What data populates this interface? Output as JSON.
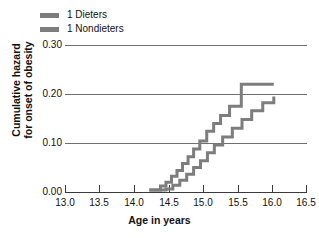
{
  "legend": {
    "items": [
      {
        "label": "1 Dieters",
        "color": "#7d7d7d",
        "key": "dieters"
      },
      {
        "label": "1 Nondieters",
        "color": "#7d7d7d",
        "key": "nondieters"
      }
    ]
  },
  "axes": {
    "x_label": "Age in years",
    "y_label_line1": "Cumulative hazard",
    "y_label_line2": "for onset of obesity",
    "x_ticks": [
      "13.0",
      "13.5",
      "14.0",
      "14.5",
      "15.0",
      "15.5",
      "16.0",
      "16.5"
    ],
    "y_ticks": [
      "0.30",
      "0.20",
      "0.10",
      "0.00"
    ]
  },
  "chart_data": {
    "type": "line",
    "subtype": "step",
    "title": "",
    "xlabel": "Age in years",
    "ylabel": "Cumulative hazard for onset of obesity",
    "xlim": [
      13.0,
      16.5
    ],
    "ylim": [
      0.0,
      0.3
    ],
    "xticks": [
      13.0,
      13.5,
      14.0,
      14.5,
      15.0,
      15.5,
      16.0,
      16.5
    ],
    "yticks": [
      0.0,
      0.1,
      0.2,
      0.3
    ],
    "grid": "horizontal",
    "legend_position": "top-left-outside",
    "line_color": "#7d7d7d",
    "line_width": 3,
    "series": [
      {
        "name": "1 Dieters",
        "color": "#7d7d7d",
        "x": [
          14.22,
          14.3,
          14.38,
          14.46,
          14.54,
          14.62,
          14.7,
          14.78,
          14.86,
          14.95,
          15.05,
          15.15,
          15.25,
          15.38,
          15.55,
          16.02
        ],
        "values": [
          0.004,
          0.004,
          0.012,
          0.02,
          0.032,
          0.044,
          0.058,
          0.072,
          0.088,
          0.104,
          0.124,
          0.14,
          0.156,
          0.175,
          0.22,
          0.22
        ]
      },
      {
        "name": "1 Nondieters",
        "color": "#7d7d7d",
        "x": [
          14.22,
          14.34,
          14.46,
          14.56,
          14.66,
          14.76,
          14.86,
          14.96,
          15.06,
          15.16,
          15.28,
          15.42,
          15.56,
          15.7,
          15.86,
          16.02
        ],
        "values": [
          0.004,
          0.004,
          0.006,
          0.014,
          0.024,
          0.036,
          0.05,
          0.064,
          0.08,
          0.096,
          0.112,
          0.13,
          0.148,
          0.166,
          0.182,
          0.195
        ]
      }
    ]
  }
}
